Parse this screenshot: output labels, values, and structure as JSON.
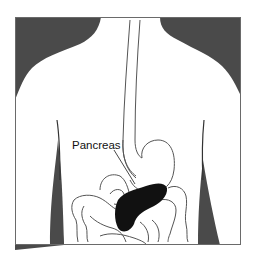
{
  "figure": {
    "labels": [
      {
        "id": "pancreas",
        "text": "Pancreas"
      }
    ]
  },
  "colors": {
    "background": "#ffffff",
    "frame": "#6a6a6a",
    "body_silhouette": "#4a4a4a",
    "organ_outline": "#555555",
    "pancreas_fill": "#111111"
  }
}
